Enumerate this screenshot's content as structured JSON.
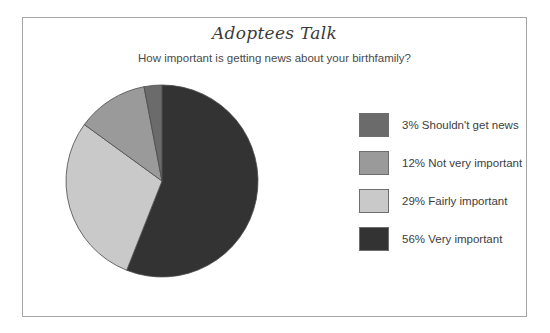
{
  "chart_data": {
    "type": "pie",
    "title": "Adoptees Talk",
    "subtitle": "How important is getting news about your birthfamily?",
    "xlabel": "",
    "ylabel": "",
    "legend_position": "right",
    "grid": false,
    "start_angle_deg": 0,
    "direction": "clockwise",
    "categories": [
      "Shouldn't get news",
      "Not very important",
      "Fairly important",
      "Very important"
    ],
    "values": [
      3,
      12,
      29,
      56
    ],
    "value_unit": "%",
    "slice_colors": [
      "#6b6b6b",
      "#9a9a9a",
      "#c9c9c9",
      "#333333"
    ],
    "slices": [
      {
        "label": "Shouldn't get news",
        "value": 3,
        "legend_text": "3% Shouldn't get news",
        "color": "#6b6b6b"
      },
      {
        "label": "Not very important",
        "value": 12,
        "legend_text": "12% Not very important",
        "color": "#9a9a9a"
      },
      {
        "label": "Fairly important",
        "value": 29,
        "legend_text": "29% Fairly important",
        "color": "#c9c9c9"
      },
      {
        "label": "Very important",
        "value": 56,
        "legend_text": "56% Very important",
        "color": "#333333"
      }
    ]
  },
  "frame": {
    "border_color": "#a6a6a6",
    "background": "#ffffff"
  }
}
